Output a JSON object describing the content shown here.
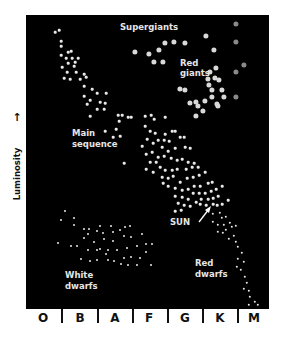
{
  "diagram": {
    "type": "Hertzsprung-Russell diagram",
    "y_axis_label": "Luminosity",
    "y_axis_arrow": "↑",
    "x_axis_categories": [
      "O",
      "B",
      "A",
      "F",
      "G",
      "K",
      "M"
    ],
    "region_labels": {
      "supergiants": "Supergiants",
      "red_giants_1": "Red",
      "red_giants_2": "giants",
      "main_sequence_1": "Main",
      "main_sequence_2": "sequence",
      "sun": "SUN",
      "white_dwarfs_1": "White",
      "white_dwarfs_2": "dwarfs",
      "red_dwarfs_1": "Red",
      "red_dwarfs_2": "dwarfs"
    },
    "colors": {
      "background": "#000000",
      "star_small": "#e8e8e8",
      "star_giant": "#d9d9d9",
      "star_dim": "#8a8a8a",
      "label": "#e6e6e6"
    }
  },
  "stars": {
    "main_sequence": [
      [
        59,
        30
      ],
      [
        55,
        32
      ],
      [
        61,
        41
      ],
      [
        61,
        46
      ],
      [
        68,
        52
      ],
      [
        71,
        51
      ],
      [
        61,
        55
      ],
      [
        66,
        58
      ],
      [
        72,
        58
      ],
      [
        78,
        58
      ],
      [
        68,
        63
      ],
      [
        75,
        62
      ],
      [
        62,
        67
      ],
      [
        74,
        66
      ],
      [
        67,
        72
      ],
      [
        76,
        72
      ],
      [
        84,
        74
      ],
      [
        64,
        78
      ],
      [
        70,
        79
      ],
      [
        80,
        79
      ],
      [
        86,
        77
      ],
      [
        84,
        86
      ],
      [
        92,
        89
      ],
      [
        84,
        96
      ],
      [
        90,
        100
      ],
      [
        100,
        102
      ],
      [
        105,
        103
      ],
      [
        106,
        93
      ],
      [
        97,
        93
      ],
      [
        87,
        104
      ],
      [
        97,
        109
      ],
      [
        90,
        116
      ],
      [
        104,
        109
      ],
      [
        118,
        115
      ],
      [
        122,
        115
      ],
      [
        128,
        117
      ],
      [
        119,
        121
      ],
      [
        131,
        117
      ],
      [
        145,
        116
      ],
      [
        151,
        115
      ],
      [
        154,
        119
      ],
      [
        165,
        117
      ],
      [
        116,
        129
      ],
      [
        105,
        131
      ],
      [
        113,
        137
      ],
      [
        120,
        136
      ],
      [
        145,
        126
      ],
      [
        150,
        131
      ],
      [
        155,
        133
      ],
      [
        165,
        134
      ],
      [
        142,
        146
      ],
      [
        147,
        139
      ],
      [
        153,
        143
      ],
      [
        158,
        140
      ],
      [
        164,
        140
      ],
      [
        169,
        141
      ],
      [
        172,
        131
      ],
      [
        175,
        131
      ],
      [
        180,
        137
      ],
      [
        184,
        137
      ],
      [
        162,
        147
      ],
      [
        168,
        151
      ],
      [
        175,
        148
      ],
      [
        185,
        147
      ],
      [
        190,
        148
      ],
      [
        146,
        154
      ],
      [
        152,
        152
      ],
      [
        158,
        157
      ],
      [
        164,
        156
      ],
      [
        171,
        158
      ],
      [
        177,
        160
      ],
      [
        182,
        159
      ],
      [
        188,
        162
      ],
      [
        194,
        163
      ],
      [
        150,
        162
      ],
      [
        156,
        162
      ],
      [
        160,
        167
      ],
      [
        165,
        170
      ],
      [
        172,
        170
      ],
      [
        177,
        169
      ],
      [
        186,
        169
      ],
      [
        192,
        167
      ],
      [
        198,
        167
      ],
      [
        146,
        169
      ],
      [
        153,
        172
      ],
      [
        162,
        177
      ],
      [
        168,
        178
      ],
      [
        173,
        176
      ],
      [
        180,
        182
      ],
      [
        187,
        178
      ],
      [
        193,
        177
      ],
      [
        199,
        175
      ],
      [
        205,
        172
      ],
      [
        163,
        183
      ],
      [
        168,
        186
      ],
      [
        175,
        188
      ],
      [
        182,
        190
      ],
      [
        188,
        189
      ],
      [
        194,
        186
      ],
      [
        200,
        186
      ],
      [
        208,
        183
      ],
      [
        212,
        182
      ],
      [
        175,
        196
      ],
      [
        182,
        197
      ],
      [
        188,
        199
      ],
      [
        193,
        193
      ],
      [
        199,
        193
      ],
      [
        205,
        193
      ],
      [
        211,
        191
      ],
      [
        216,
        189
      ],
      [
        222,
        186
      ],
      [
        178,
        203
      ],
      [
        184,
        205
      ],
      [
        190,
        206
      ],
      [
        196,
        202
      ],
      [
        201,
        199
      ],
      [
        208,
        199
      ],
      [
        213,
        198
      ],
      [
        218,
        196
      ],
      [
        124,
        163
      ],
      [
        175,
        211
      ],
      [
        181,
        210
      ],
      [
        200,
        204
      ],
      [
        206,
        205
      ],
      [
        213,
        204
      ],
      [
        217,
        205
      ],
      [
        222,
        204
      ],
      [
        228,
        200
      ]
    ],
    "red_dwarfs": [
      [
        213,
        214
      ],
      [
        220,
        213
      ],
      [
        222,
        218
      ],
      [
        226,
        217
      ],
      [
        213,
        222
      ],
      [
        218,
        225
      ],
      [
        224,
        225
      ],
      [
        230,
        223
      ],
      [
        232,
        227
      ],
      [
        218,
        232
      ],
      [
        223,
        233
      ],
      [
        226,
        230
      ],
      [
        236,
        226
      ],
      [
        229,
        239
      ],
      [
        234,
        236
      ],
      [
        236,
        242
      ],
      [
        238,
        247
      ],
      [
        242,
        253
      ],
      [
        238,
        259
      ],
      [
        244,
        262
      ],
      [
        237,
        267
      ],
      [
        241,
        270
      ],
      [
        245,
        277
      ],
      [
        247,
        283
      ],
      [
        244,
        289
      ],
      [
        249,
        291
      ],
      [
        250,
        297
      ],
      [
        255,
        302
      ],
      [
        258,
        305
      ],
      [
        249,
        305
      ]
    ],
    "white_dwarfs": [
      [
        65,
        211
      ],
      [
        61,
        220
      ],
      [
        74,
        218
      ],
      [
        74,
        225
      ],
      [
        84,
        229
      ],
      [
        89,
        229
      ],
      [
        100,
        226
      ],
      [
        111,
        226
      ],
      [
        125,
        227
      ],
      [
        130,
        226
      ],
      [
        58,
        243
      ],
      [
        71,
        246
      ],
      [
        77,
        246
      ],
      [
        88,
        234
      ],
      [
        97,
        231
      ],
      [
        103,
        233
      ],
      [
        113,
        232
      ],
      [
        120,
        230
      ],
      [
        84,
        238
      ],
      [
        94,
        242
      ],
      [
        104,
        239
      ],
      [
        113,
        241
      ],
      [
        124,
        236
      ],
      [
        131,
        237
      ],
      [
        142,
        234
      ],
      [
        146,
        244
      ],
      [
        152,
        244
      ],
      [
        88,
        250
      ],
      [
        97,
        250
      ],
      [
        108,
        250
      ],
      [
        117,
        250
      ],
      [
        127,
        248
      ],
      [
        137,
        246
      ],
      [
        146,
        252
      ],
      [
        81,
        259
      ],
      [
        90,
        261
      ],
      [
        97,
        260
      ],
      [
        108,
        260
      ],
      [
        114,
        261
      ],
      [
        124,
        258
      ],
      [
        131,
        257
      ],
      [
        140,
        258
      ],
      [
        121,
        264
      ],
      [
        128,
        265
      ],
      [
        137,
        265
      ],
      [
        151,
        265
      ],
      [
        100,
        249
      ],
      [
        106,
        254
      ]
    ],
    "giants": [
      [
        135,
        52
      ],
      [
        149,
        54
      ],
      [
        154,
        62
      ],
      [
        159,
        50
      ],
      [
        163,
        62
      ],
      [
        165,
        43
      ],
      [
        174,
        42
      ],
      [
        185,
        43
      ],
      [
        206,
        36
      ],
      [
        214,
        50
      ],
      [
        185,
        90
      ],
      [
        180,
        89
      ],
      [
        210,
        72
      ],
      [
        216,
        68
      ],
      [
        208,
        79
      ],
      [
        215,
        78
      ],
      [
        209,
        85
      ],
      [
        212,
        90
      ],
      [
        219,
        80
      ],
      [
        217,
        104
      ],
      [
        222,
        90
      ],
      [
        212,
        97
      ],
      [
        224,
        97
      ],
      [
        205,
        101
      ],
      [
        203,
        111
      ],
      [
        196,
        116
      ],
      [
        218,
        106
      ],
      [
        196,
        102
      ],
      [
        190,
        103
      ],
      [
        198,
        106
      ]
    ],
    "dim_m": [
      [
        236,
        24
      ],
      [
        236,
        42
      ],
      [
        236,
        72
      ],
      [
        244,
        65
      ],
      [
        236,
        97
      ]
    ]
  }
}
